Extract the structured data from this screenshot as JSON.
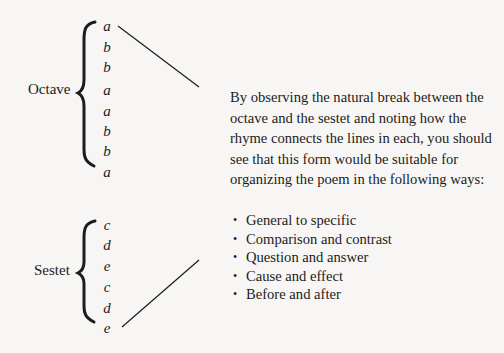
{
  "octave": {
    "label": "Octave",
    "rhymes": [
      "a",
      "b",
      "b",
      "a",
      "a",
      "b",
      "b",
      "a"
    ]
  },
  "sestet": {
    "label": "Sestet",
    "rhymes": [
      "c",
      "d",
      "e",
      "c",
      "d",
      "e"
    ]
  },
  "explanation": "By observing the natural break between the octave and the sestet and noting how the rhyme connects the lines in each, you should see that this form would be suitable for organizing the poem in the following ways:",
  "ways": [
    "General to specific",
    "Comparison and contrast",
    "Question and answer",
    "Cause and effect",
    "Before and after"
  ]
}
